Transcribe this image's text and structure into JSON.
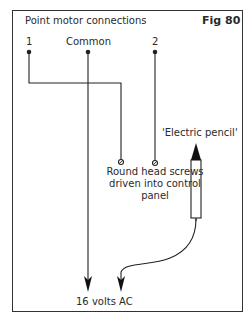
{
  "diagram": {
    "title": "Point motor connections",
    "figure_label": "Fig 80",
    "terminals": [
      {
        "id": "1",
        "label": "1"
      },
      {
        "id": "common",
        "label": "Common"
      },
      {
        "id": "2",
        "label": "2"
      }
    ],
    "screws_label_line1": "Round head screws",
    "screws_label_line2": "driven into control",
    "screws_label_line3": "panel",
    "pencil_label": "'Electric pencil'",
    "supply_label": "16 volts AC",
    "colors": {
      "line": "#222222",
      "background": "#ffffff"
    }
  }
}
